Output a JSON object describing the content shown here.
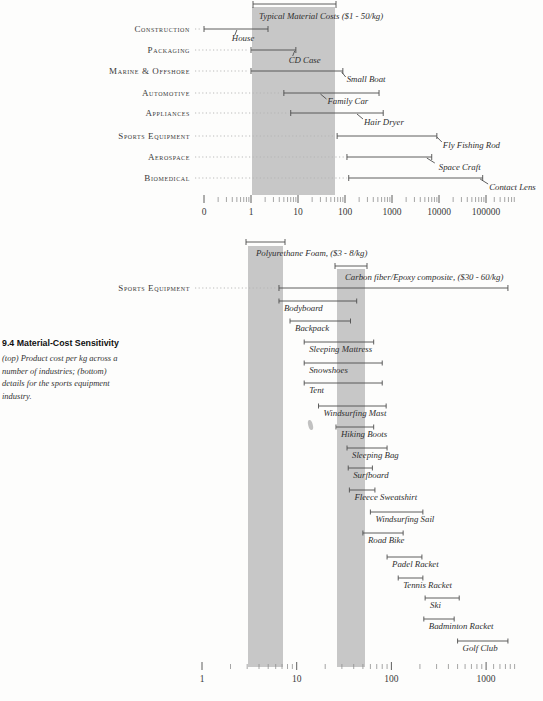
{
  "caption": {
    "heading": "9.4 Material-Cost Sensitivity",
    "lines": [
      "(top) Product cost per kg across a",
      "number of industries; (bottom)",
      "details for the sports equipment",
      "industry."
    ]
  },
  "colors": {
    "band": "#c7c7c7",
    "line": "#4d4d4d",
    "leader_dots": "#b3b3b3",
    "text": "#2e2e2e"
  },
  "chart_data": [
    {
      "type": "range-bar",
      "title": "Typical Material Costs ($1 - 50/kg)",
      "xlabel": "",
      "scale": "log",
      "band": {
        "label": "Typical Material Costs ($1 - 50/kg)",
        "from": 1,
        "to": 50
      },
      "axis": {
        "tick_labels": [
          "0",
          "1",
          "10",
          "100",
          "1000",
          "10000",
          "100000"
        ],
        "tick_values": [
          0.1,
          1,
          10,
          100,
          1000,
          10000,
          100000
        ]
      },
      "rows": [
        {
          "industry": "Construction",
          "min": 0.1,
          "max": 2.3,
          "product": "House",
          "product_value": 0.5
        },
        {
          "industry": "Packaging",
          "min": 1,
          "max": 9,
          "product": "CD Case",
          "product_value": 8.5
        },
        {
          "industry": "Marine & Offshore",
          "min": 1,
          "max": 90,
          "product": "Small Boat",
          "product_value": 85
        },
        {
          "industry": "Automotive",
          "min": 5,
          "max": 530,
          "product": "Family Car",
          "product_value": 30
        },
        {
          "industry": "Appliances",
          "min": 7,
          "max": 650,
          "product": "Hair Dryer",
          "product_value": 180
        },
        {
          "industry": "Sports Equipment",
          "min": 68,
          "max": 9000,
          "product": "Fly Fishing Rod",
          "product_value": 9000
        },
        {
          "industry": "Aerospace",
          "min": 110,
          "max": 7000,
          "product": "Space Craft",
          "product_value": 5500
        },
        {
          "industry": "Biomedical",
          "min": 120,
          "max": 85000,
          "product": "Contact Lens",
          "product_value": 75000
        }
      ]
    },
    {
      "type": "range-bar",
      "scale": "log",
      "industry_row": {
        "label": "Sports Equipment",
        "min": 6.5,
        "max": 1700
      },
      "bands": [
        {
          "label": "Polyurethane Foam, ($3 - 8/kg)",
          "from": 3,
          "to": 8
        },
        {
          "label": "Carbon fiber/Epoxy composite, ($30 - 60/kg)",
          "from": 30,
          "to": 60
        }
      ],
      "axis": {
        "tick_labels": [
          "1",
          "10",
          "100",
          "1000"
        ],
        "tick_values": [
          1,
          10,
          100,
          1000
        ]
      },
      "items": [
        {
          "label": "Bodyboard",
          "min": 6.5,
          "max": 43
        },
        {
          "label": "Backpack",
          "min": 8.5,
          "max": 37
        },
        {
          "label": "Sleeping Mattress",
          "min": 12,
          "max": 65
        },
        {
          "label": "Snowshoes",
          "min": 12,
          "max": 80
        },
        {
          "label": "Tent",
          "min": 12,
          "max": 80
        },
        {
          "label": "Windsurfing Mast",
          "min": 17,
          "max": 88
        },
        {
          "label": "Hiking Boots",
          "min": 26,
          "max": 65
        },
        {
          "label": "Sleeping Bag",
          "min": 34,
          "max": 90
        },
        {
          "label": "Surfboard",
          "min": 35,
          "max": 63
        },
        {
          "label": "Fleece Sweatshirt",
          "min": 36,
          "max": 67
        },
        {
          "label": "Windsurfing Sail",
          "min": 60,
          "max": 215
        },
        {
          "label": "Road Bike",
          "min": 50,
          "max": 133
        },
        {
          "label": "Padel Racket",
          "min": 90,
          "max": 210
        },
        {
          "label": "Tennis Racket",
          "min": 118,
          "max": 215
        },
        {
          "label": "Ski",
          "min": 227,
          "max": 520
        },
        {
          "label": "Badminton Racket",
          "min": 220,
          "max": 460
        },
        {
          "label": "Golf Club",
          "min": 500,
          "max": 1700
        }
      ]
    }
  ]
}
